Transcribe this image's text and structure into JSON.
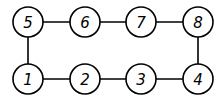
{
  "graph": {
    "nodes": [
      {
        "id": "5",
        "label": "5",
        "x": 28,
        "y": 22
      },
      {
        "id": "6",
        "label": "6",
        "x": 85,
        "y": 22
      },
      {
        "id": "7",
        "label": "7",
        "x": 141,
        "y": 22
      },
      {
        "id": "8",
        "label": "8",
        "x": 198,
        "y": 22
      },
      {
        "id": "1",
        "label": "1",
        "x": 28,
        "y": 79
      },
      {
        "id": "2",
        "label": "2",
        "x": 85,
        "y": 79
      },
      {
        "id": "3",
        "label": "3",
        "x": 141,
        "y": 79
      },
      {
        "id": "4",
        "label": "4",
        "x": 198,
        "y": 79
      }
    ],
    "edges": [
      [
        "5",
        "6"
      ],
      [
        "6",
        "7"
      ],
      [
        "7",
        "8"
      ],
      [
        "5",
        "1"
      ],
      [
        "8",
        "4"
      ],
      [
        "1",
        "2"
      ],
      [
        "2",
        "3"
      ],
      [
        "3",
        "4"
      ]
    ],
    "node_radius": 15
  }
}
